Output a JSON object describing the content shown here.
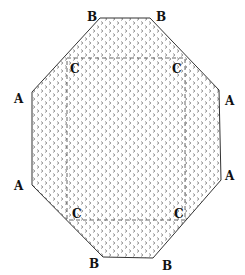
{
  "diagram": {
    "type": "octagon-with-inner-rectangle",
    "fill_pattern": "chevron-dots",
    "colors": {
      "outline": "#333333",
      "pattern": "#8a8a8a",
      "dashed": "#555555",
      "label": "#111111",
      "background": "#ffffff"
    },
    "outer_polygon": [
      [
        100,
        18
      ],
      [
        150,
        18
      ],
      [
        219,
        90
      ],
      [
        221,
        180
      ],
      [
        153,
        258
      ],
      [
        103,
        257
      ],
      [
        32,
        185
      ],
      [
        32,
        92
      ]
    ],
    "inner_rectangle": {
      "x": 67,
      "y": 58,
      "width": 118,
      "height": 162
    },
    "labels": [
      {
        "id": "B-top-left",
        "text": "B",
        "x": 87,
        "y": 21
      },
      {
        "id": "B-top-right",
        "text": "B",
        "x": 156,
        "y": 21
      },
      {
        "id": "A-upper-left",
        "text": "A",
        "x": 14,
        "y": 103
      },
      {
        "id": "A-upper-right",
        "text": "A",
        "x": 225,
        "y": 105
      },
      {
        "id": "A-lower-left",
        "text": "A",
        "x": 14,
        "y": 190
      },
      {
        "id": "A-lower-right",
        "text": "A",
        "x": 225,
        "y": 180
      },
      {
        "id": "C-upper-left",
        "text": "C",
        "x": 70,
        "y": 73
      },
      {
        "id": "C-upper-right",
        "text": "C",
        "x": 172,
        "y": 73
      },
      {
        "id": "C-lower-left",
        "text": "C",
        "x": 72,
        "y": 218
      },
      {
        "id": "C-lower-right",
        "text": "C",
        "x": 174,
        "y": 218
      },
      {
        "id": "B-bottom-left",
        "text": "B",
        "x": 89,
        "y": 268
      },
      {
        "id": "B-bottom-right",
        "text": "B",
        "x": 162,
        "y": 270
      }
    ]
  }
}
